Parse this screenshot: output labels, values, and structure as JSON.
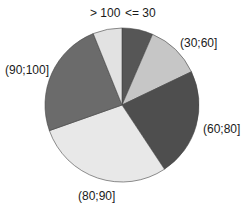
{
  "chart_data": {
    "type": "pie",
    "title": "",
    "categories": [
      "<= 30",
      "(30;60]",
      "(60;80]",
      "(80;90]",
      "(90;100]",
      "> 100"
    ],
    "values": [
      6.5,
      11.4,
      22.8,
      28.9,
      24.3,
      6.1
    ],
    "unit": "percent (estimated from slice angles)",
    "start_angle_deg": 0,
    "direction": "clockwise",
    "colors": [
      "#565656",
      "#c6c6c6",
      "#4e4e4e",
      "#e8e8e8",
      "#6b6b6b",
      "#e2e2e2"
    ],
    "legend": "none",
    "labels": [
      {
        "text": "<= 30",
        "x": 125,
        "y": 17
      },
      {
        "text": "(30;60]",
        "x": 180,
        "y": 47
      },
      {
        "text": "(60;80]",
        "x": 203,
        "y": 133
      },
      {
        "text": "(80;90]",
        "x": 78,
        "y": 200
      },
      {
        "text": "(90;100]",
        "x": 5,
        "y": 74
      },
      {
        "text": "> 100",
        "x": 90,
        "y": 17
      }
    ]
  },
  "layout": {
    "center_x": 122,
    "center_y": 105,
    "radius": 77
  }
}
